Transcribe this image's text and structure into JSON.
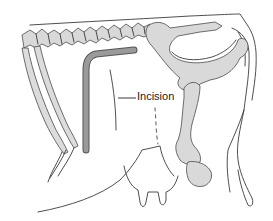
{
  "figure": {
    "labels": {
      "incision": "Incision"
    },
    "colors": {
      "bone_fill": "#d9d9d9",
      "incision_fill": "#9a9a9a",
      "line": "#3a3a3a",
      "background": "#ffffff"
    }
  }
}
